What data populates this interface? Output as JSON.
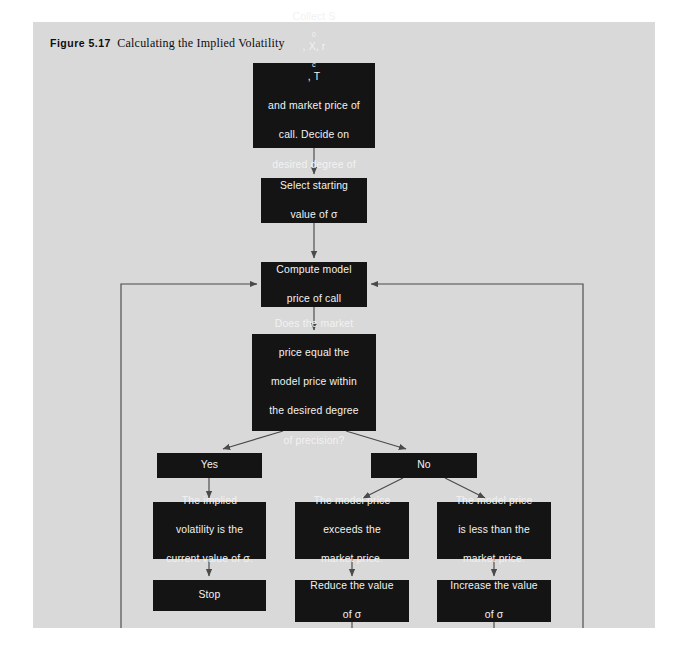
{
  "figure": {
    "label": "Figure 5.17",
    "title": "Calculating the Implied Volatility",
    "panel_color": "#d9d9d9",
    "node_color": "#141414",
    "node_text_color": "#f2f2f2",
    "connector_color": "#4a4a4a"
  },
  "nodes": {
    "collect": {
      "id": "collect-inputs",
      "line1_pre": "Collect S",
      "line1_sub1": "0",
      "line1_mid": ", X, r",
      "line1_sub2": "c",
      "line1_post": ", T",
      "line2": "and market price of",
      "line3": "call. Decide on",
      "line4": "desired degree of",
      "line5": "precision."
    },
    "select": {
      "id": "select-starting-value",
      "line1": "Select starting",
      "line2": "value of σ"
    },
    "compute": {
      "id": "compute-model-price",
      "line1": "Compute model",
      "line2": "price of call"
    },
    "decision": {
      "id": "precision-decision",
      "line1": "Does the market",
      "line2": "price equal the",
      "line3": "model price within",
      "line4": "the desired degree",
      "line5": "of precision?"
    },
    "yes": {
      "id": "branch-yes",
      "label": "Yes"
    },
    "no": {
      "id": "branch-no",
      "label": "No"
    },
    "implied": {
      "id": "implied-volatility-result",
      "line1": "The implied",
      "line2": "volatility is the",
      "line3": "current value of σ."
    },
    "exceeds": {
      "id": "model-exceeds-market",
      "line1": "The model price",
      "line2": "exceeds the",
      "line3": "market price."
    },
    "less": {
      "id": "model-less-than-market",
      "line1": "The model price",
      "line2": "is less than the",
      "line3": "market price."
    },
    "stop": {
      "id": "stop",
      "label": "Stop"
    },
    "reduce": {
      "id": "reduce-sigma",
      "line1": "Reduce the value",
      "line2": "of σ"
    },
    "increase": {
      "id": "increase-sigma",
      "line1": "Increase the value",
      "line2": "of σ"
    }
  }
}
